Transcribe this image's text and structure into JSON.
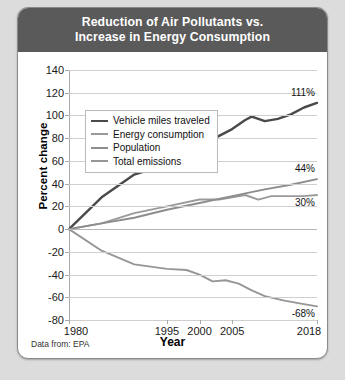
{
  "card": {
    "title_line1": "Reduction of Air Pollutants vs.",
    "title_line2": "Increase in Energy Consumption",
    "source_note": "Data from: EPA"
  },
  "chart_data": {
    "type": "line",
    "title": "Reduction of Air Pollutants vs. Increase in Energy Consumption",
    "xlabel": "Year",
    "ylabel": "Percent change",
    "xlim": [
      1980,
      2018
    ],
    "ylim": [
      -80,
      140
    ],
    "ytick_labels": [
      "140",
      "120",
      "100",
      "80",
      "60",
      "40",
      "20",
      "0",
      "-20",
      "-40",
      "-60",
      "-80"
    ],
    "ytick_values": [
      140,
      120,
      100,
      80,
      60,
      40,
      20,
      0,
      -20,
      -40,
      -60,
      -80
    ],
    "xtick_labels": [
      "1980",
      "1995",
      "2000",
      "2005",
      "2018"
    ],
    "xtick_values": [
      1980,
      1995,
      2000,
      2005,
      2018
    ],
    "grid": true,
    "legend_position": "upper-left-inside",
    "source": "Data from: EPA",
    "series": [
      {
        "name": "Vehicle miles traveled",
        "color": "#4a4a4a",
        "end_label": "111%",
        "x": [
          1980,
          1985,
          1990,
          1995,
          1997,
          1999,
          2001,
          2003,
          2005,
          2007,
          2008,
          2010,
          2012,
          2014,
          2016,
          2018
        ],
        "values": [
          0,
          28,
          48,
          57,
          63,
          70,
          76,
          82,
          88,
          96,
          99,
          95,
          97,
          101,
          107,
          111
        ]
      },
      {
        "name": "Energy consumption",
        "color": "#9a9a9a",
        "end_label": "30%",
        "x": [
          1980,
          1985,
          1990,
          1995,
          2000,
          2003,
          2005,
          2007,
          2009,
          2011,
          2013,
          2016,
          2018
        ],
        "values": [
          0,
          5,
          14,
          20,
          26,
          26,
          28,
          30,
          26,
          29,
          29,
          29,
          30
        ]
      },
      {
        "name": "Population",
        "color": "#8d8d8d",
        "end_label": "44%",
        "x": [
          1980,
          1985,
          1990,
          1995,
          2000,
          2005,
          2010,
          2014,
          2018
        ],
        "values": [
          0,
          5,
          10,
          17,
          23,
          29,
          35,
          39,
          44
        ]
      },
      {
        "name": "Total emissions",
        "color": "#969696",
        "end_label": "-68%",
        "x": [
          1980,
          1985,
          1990,
          1995,
          1998,
          2000,
          2002,
          2004,
          2006,
          2008,
          2010,
          2013,
          2016,
          2018
        ],
        "values": [
          0,
          -19,
          -31,
          -35,
          -36,
          -40,
          -46,
          -45,
          -48,
          -54,
          -59,
          -63,
          -66,
          -68
        ]
      }
    ],
    "data_labels": [
      {
        "text": "111%",
        "series": "Vehicle miles traveled",
        "value": 111
      },
      {
        "text": "44%",
        "series": "Population",
        "value": 44
      },
      {
        "text": "30%",
        "series": "Energy consumption",
        "value": 30
      },
      {
        "text": "-68%",
        "series": "Total emissions",
        "value": -68
      }
    ]
  }
}
